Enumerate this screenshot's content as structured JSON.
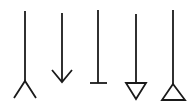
{
  "diagram": {
    "title": "",
    "stroke_color": "#1a1a1a",
    "background": "#ffffff",
    "arrows": [
      {
        "name": "crows-foot",
        "type": "many-crows-foot"
      },
      {
        "name": "open-arrow",
        "type": "open-arrowhead"
      },
      {
        "name": "t-bar",
        "type": "bar-terminator"
      },
      {
        "name": "triangle-down",
        "type": "hollow-triangle-pointing-down"
      },
      {
        "name": "triangle-up",
        "type": "hollow-triangle-pointing-up"
      }
    ]
  }
}
